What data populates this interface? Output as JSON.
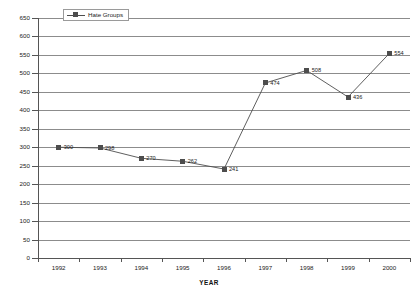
{
  "chart_data": {
    "type": "line",
    "title": "",
    "xlabel": "YEAR",
    "ylabel": "",
    "categories": [
      "1992",
      "1993",
      "1994",
      "1995",
      "1996",
      "1997",
      "1998",
      "1999",
      "2000"
    ],
    "series": [
      {
        "name": "Hate Groups",
        "values": [
          300,
          298,
          270,
          262,
          241,
          474,
          508,
          436,
          554
        ],
        "point_labels": [
          "300",
          "298",
          "270",
          "262",
          "241",
          "474",
          "508",
          "436",
          "554"
        ],
        "color": "#4d4d4d",
        "marker": "square"
      }
    ],
    "ylim": [
      0,
      650
    ],
    "ytick_step": 50,
    "ytick_labels": [
      "0",
      "50",
      "100",
      "150",
      "200",
      "250",
      "300",
      "350",
      "400",
      "450",
      "500",
      "550",
      "600",
      "650"
    ],
    "grid": "horizontal",
    "legend_position": "top-left",
    "background": "#ffffff",
    "gridline_color": "#8c8c8c",
    "axis_color": "#555555"
  },
  "legend": {
    "entries": [
      {
        "label": "Hate Groups"
      }
    ]
  },
  "axes": {
    "x_title": "YEAR"
  }
}
